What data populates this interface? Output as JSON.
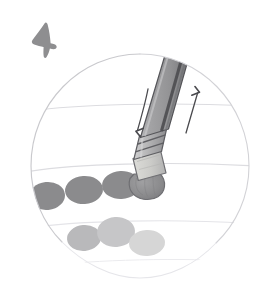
{
  "canvas": {
    "width": 275,
    "height": 289,
    "background_color": "#ffffff",
    "title": "Pencil eraser dabbing technique",
    "description": "Hand-drawn sketch inside a faint circular vignette showing a pencil held eraser-down with up and down motion arrows, above two rows of erased dabs fading from dark grey to light grey."
  },
  "marker": {
    "name": "hand-drawn-arrow-mark",
    "color": "#8e8e90",
    "position": {
      "x": 30,
      "y": 22,
      "width": 26,
      "height": 35
    },
    "label": "arrow mark"
  },
  "vignette": {
    "name": "circle-vignette",
    "center_x": 140,
    "center_y": 166,
    "radius_x": 109,
    "radius_y": 112,
    "stroke_color": "#cfcfd2",
    "stroke_width": 1.1,
    "fill_color": "#ffffff"
  },
  "guide_lines": [
    {
      "name": "guide-line-1",
      "y": 108,
      "color": "#dcdce0"
    },
    {
      "name": "guide-line-2",
      "y": 166,
      "color": "#dcdce0"
    },
    {
      "name": "guide-line-3",
      "y": 224,
      "color": "#e4e4e8"
    },
    {
      "name": "guide-line-4",
      "y": 262,
      "color": "#ebebee"
    }
  ],
  "pencil": {
    "name": "pencil",
    "angle_deg": 17,
    "barrel": {
      "name": "pencil-barrel",
      "light_color": "#9b9b9d",
      "mid_color": "#8a8a8d",
      "dark_color": "#5f6063",
      "outline_color": "#555558",
      "top_x": 185,
      "top_y": 40,
      "bottom_x": 152,
      "bottom_y": 146,
      "width": 26
    },
    "ferrule": {
      "name": "pencil-ferrule",
      "color": "#b6b6b8",
      "band_color": "#6c6c70",
      "bands": 3
    },
    "eraser_band": {
      "name": "pencil-eraser-band",
      "color": "#c9c9c7"
    },
    "eraser_tip": {
      "name": "pencil-eraser-tip",
      "color": "#8c8c8e",
      "outline_color": "#6e6e72",
      "center_x": 146,
      "center_y": 186,
      "radius_x": 17,
      "radius_y": 13
    }
  },
  "motion_arrows": [
    {
      "name": "down-arrow",
      "direction": "down",
      "color": "#4a4a4e",
      "x1": 147,
      "y1": 90,
      "x2": 138,
      "y2": 132
    },
    {
      "name": "up-arrow",
      "direction": "up",
      "color": "#4a4a4e",
      "x1": 187,
      "y1": 132,
      "x2": 198,
      "y2": 92
    }
  ],
  "dab_rows": [
    {
      "name": "dab-row-dark",
      "label": "first pass dabs",
      "dabs": [
        {
          "name": "dab",
          "cx": 47,
          "cy": 196,
          "rx": 18,
          "ry": 14,
          "color": "#8b8b8d",
          "rotate": -6
        },
        {
          "name": "dab",
          "cx": 84,
          "cy": 190,
          "rx": 19,
          "ry": 14,
          "color": "#8b8b8d",
          "rotate": -4
        },
        {
          "name": "dab",
          "cx": 121,
          "cy": 185,
          "rx": 19,
          "ry": 14,
          "color": "#8b8b8d",
          "rotate": -3
        }
      ]
    },
    {
      "name": "dab-row-light",
      "label": "fading pass dabs",
      "dabs": [
        {
          "name": "dab",
          "cx": 84,
          "cy": 238,
          "rx": 17,
          "ry": 13,
          "color": "#b9b9bb",
          "rotate": -5
        },
        {
          "name": "dab",
          "cx": 116,
          "cy": 232,
          "rx": 19,
          "ry": 15,
          "color": "#c6c6c8",
          "rotate": -4
        },
        {
          "name": "dab",
          "cx": 147,
          "cy": 243,
          "rx": 18,
          "ry": 13,
          "color": "#d6d6d6",
          "rotate": -3
        }
      ]
    }
  ],
  "palette": {
    "paper": "#ffffff",
    "vignette_stroke": "#cfcfd2",
    "pencil_dark": "#5f6063",
    "pencil_light": "#9b9b9d",
    "eraser_tip": "#8c8c8e",
    "dab_dark": "#8b8b8d",
    "dab_light": "#d6d6d6",
    "ink": "#4a4a4e"
  }
}
